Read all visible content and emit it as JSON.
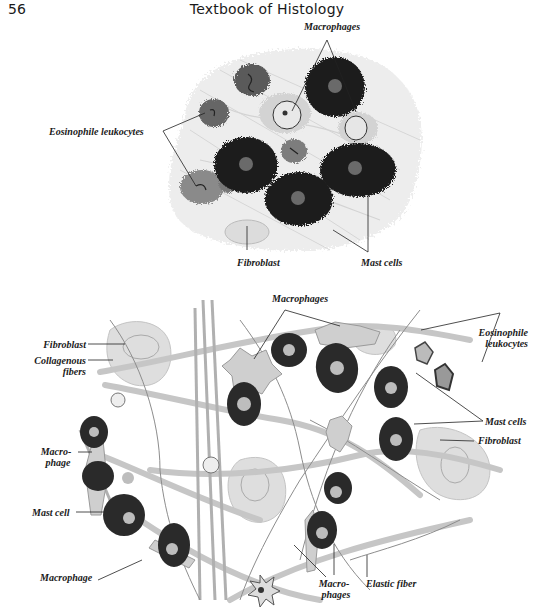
{
  "header": {
    "page_number": "56",
    "running_title": "Textbook of Histology"
  },
  "figure_top": {
    "labels": {
      "macrophages": "Macrophages",
      "eosinophile_leukocytes": "Eosinophile leukocytes",
      "fibroblast": "Fibroblast",
      "mast_cells": "Mast cells"
    },
    "colors": {
      "mast_cell": "#1c1c1c",
      "background_tissue": "#e6e6e6",
      "eosinophil": "#9a9a9a"
    }
  },
  "figure_bottom": {
    "labels": {
      "macrophages_top": "Macrophages",
      "eosinophile_line1": "Eosinophile",
      "eosinophile_line2": "leukocytes",
      "fibroblast_left": "Fibroblast",
      "collagenous_line1": "Collagenous",
      "collagenous_line2": "fibers",
      "mast_cells_right": "Mast cells",
      "fibroblast_right": "Fibroblast",
      "macrophage_left_line1": "Macro-",
      "macrophage_left_line2": "phage",
      "mast_cell_left": "Mast cell",
      "macrophage_bottom": "Macrophage",
      "macrophages_bottom_line1": "Macro-",
      "macrophages_bottom_line2": "phages",
      "elastic_fiber": "Elastic fiber"
    },
    "colors": {
      "mast_cell": "#2a2a2a",
      "nucleus": "#bdbdbd",
      "fiber": "#b5b5b5",
      "fibroblast": "#d6d6d6"
    }
  },
  "caption_fragment": "..."
}
